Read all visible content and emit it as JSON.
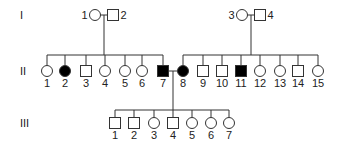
{
  "diagram": {
    "type": "pedigree",
    "colors": {
      "stroke": "#333333",
      "affected": "#000000",
      "unaffected": "#ffffff"
    },
    "generations": [
      {
        "label": "I",
        "y": 15
      },
      {
        "label": "II",
        "y": 71
      },
      {
        "label": "III",
        "y": 123
      }
    ],
    "gen1": [
      {
        "id": "1",
        "sex": "female",
        "affected": false,
        "x": 95,
        "label_side": "left"
      },
      {
        "id": "2",
        "sex": "male",
        "affected": false,
        "x": 113,
        "label_side": "right"
      },
      {
        "id": "3",
        "sex": "female",
        "affected": false,
        "x": 242,
        "label_side": "left"
      },
      {
        "id": "4",
        "sex": "male",
        "affected": false,
        "x": 260,
        "label_side": "right"
      }
    ],
    "gen2": [
      {
        "id": "1",
        "sex": "female",
        "affected": false,
        "x": 47
      },
      {
        "id": "2",
        "sex": "female",
        "affected": true,
        "x": 65
      },
      {
        "id": "3",
        "sex": "male",
        "affected": false,
        "x": 86
      },
      {
        "id": "4",
        "sex": "female",
        "affected": false,
        "x": 105
      },
      {
        "id": "5",
        "sex": "female",
        "affected": false,
        "x": 125
      },
      {
        "id": "6",
        "sex": "female",
        "affected": false,
        "x": 142
      },
      {
        "id": "7",
        "sex": "male",
        "affected": true,
        "x": 163
      },
      {
        "id": "8",
        "sex": "female",
        "affected": true,
        "x": 183
      },
      {
        "id": "9",
        "sex": "male",
        "affected": false,
        "x": 203
      },
      {
        "id": "10",
        "sex": "male",
        "affected": false,
        "x": 222
      },
      {
        "id": "11",
        "sex": "male",
        "affected": true,
        "x": 241
      },
      {
        "id": "12",
        "sex": "female",
        "affected": false,
        "x": 260
      },
      {
        "id": "13",
        "sex": "female",
        "affected": false,
        "x": 280
      },
      {
        "id": "14",
        "sex": "male",
        "affected": false,
        "x": 298
      },
      {
        "id": "15",
        "sex": "female",
        "affected": false,
        "x": 318
      }
    ],
    "gen3": [
      {
        "id": "1",
        "sex": "male",
        "affected": false,
        "x": 115
      },
      {
        "id": "2",
        "sex": "male",
        "affected": false,
        "x": 134
      },
      {
        "id": "3",
        "sex": "female",
        "affected": false,
        "x": 154
      },
      {
        "id": "4",
        "sex": "male",
        "affected": false,
        "x": 173
      },
      {
        "id": "5",
        "sex": "female",
        "affected": false,
        "x": 192
      },
      {
        "id": "6",
        "sex": "female",
        "affected": false,
        "x": 211
      },
      {
        "id": "7",
        "sex": "female",
        "affected": false,
        "x": 229
      }
    ]
  }
}
